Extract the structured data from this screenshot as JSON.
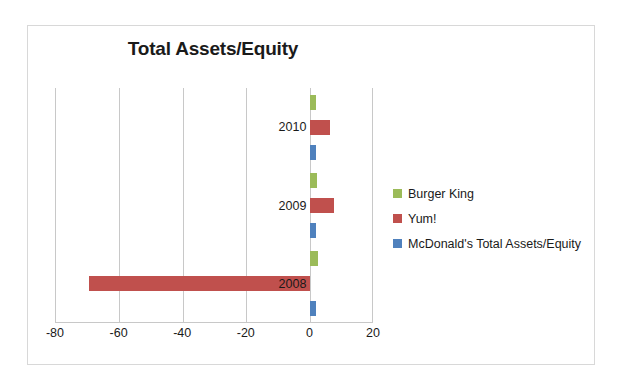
{
  "chart_data": {
    "type": "bar",
    "orientation": "horizontal",
    "title": "Total Assets/Equity",
    "xlabel": "",
    "ylabel": "",
    "categories": [
      "2010",
      "2009",
      "2008"
    ],
    "series": [
      {
        "name": "Burger King",
        "color": "#9BBB59",
        "values": [
          1.7,
          2.2,
          2.5
        ]
      },
      {
        "name": "Yum!",
        "color": "#C0504D",
        "values": [
          6.3,
          7.5,
          -69.5
        ]
      },
      {
        "name": "McDonald's Total Assets/Equity",
        "color": "#4F81BD",
        "values": [
          1.7,
          1.7,
          1.8
        ]
      }
    ],
    "xlim": [
      -80,
      20
    ],
    "xticks": [
      -80,
      -60,
      -40,
      -20,
      0,
      20
    ],
    "xticklabels": [
      "-80",
      "-60",
      "-40",
      "-20",
      "0",
      "20"
    ],
    "grid": "vertical",
    "legend_position": "right"
  },
  "legend": {
    "items": [
      {
        "label": "Burger King",
        "color": "#9BBB59"
      },
      {
        "label": "Yum!",
        "color": "#C0504D"
      },
      {
        "label": "McDonald's Total Assets/Equity",
        "color": "#4F81BD"
      }
    ]
  }
}
